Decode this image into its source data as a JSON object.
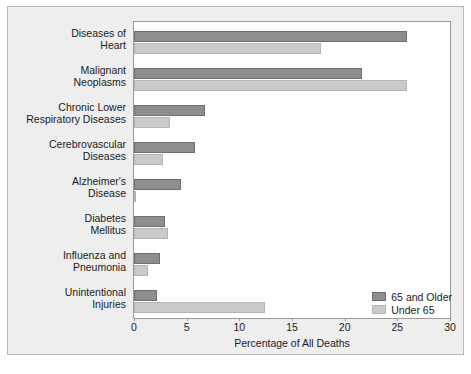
{
  "chart_data": {
    "type": "bar",
    "orientation": "horizontal",
    "title": "",
    "xlabel": "Percentage of All Deaths",
    "ylabel": "",
    "xlim": [
      0,
      30
    ],
    "xticks": [
      0,
      5,
      10,
      15,
      20,
      25,
      30
    ],
    "grid": false,
    "legend_position": "bottom-right",
    "categories": [
      "Diseases of Heart",
      "Malignant Neoplasms",
      "Chronic Lower Respiratory Diseases",
      "Cerebrovascular Diseases",
      "Alzheimer's Disease",
      "Diabetes Mellitus",
      "Influenza and Pneumonia",
      "Unintentional Injuries"
    ],
    "category_lines": [
      [
        "Diseases of",
        "Heart"
      ],
      [
        "Malignant",
        "Neoplasms"
      ],
      [
        "Chronic Lower",
        "Respiratory Diseases"
      ],
      [
        "Cerebrovascular",
        "Diseases"
      ],
      [
        "Alzheimer's",
        "Disease"
      ],
      [
        "Diabetes",
        "Mellitus"
      ],
      [
        "Influenza and",
        "Pneumonia"
      ],
      [
        "Unintentional",
        "Injuries"
      ]
    ],
    "series": [
      {
        "name": "65 and Older",
        "color": "#8e8e8e",
        "values": [
          25.9,
          21.6,
          6.7,
          5.8,
          4.5,
          2.9,
          2.5,
          2.2
        ]
      },
      {
        "name": "Under 65",
        "color": "#cacaca",
        "values": [
          17.8,
          25.9,
          3.4,
          2.8,
          0.2,
          3.2,
          1.3,
          12.4
        ]
      }
    ]
  },
  "legend": {
    "items": [
      {
        "label": "65 and Older"
      },
      {
        "label": "Under 65"
      }
    ]
  },
  "caption": {
    "text": ""
  }
}
